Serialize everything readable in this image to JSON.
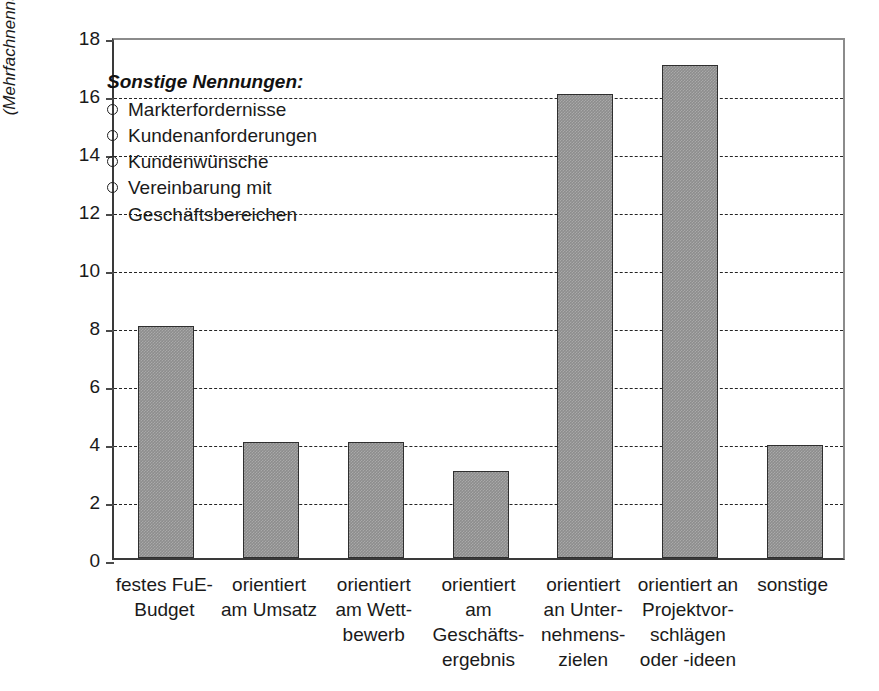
{
  "chart_data": {
    "type": "bar",
    "title": "",
    "subtitle": "",
    "xlabel": "",
    "ylabel": "Anzahl der Nennungen\n(Mehrfachnennungen möglich)",
    "ylim": [
      0,
      18
    ],
    "ytick_values": [
      0,
      2,
      4,
      6,
      8,
      10,
      12,
      14,
      16,
      18
    ],
    "ytick_labels": [
      "0",
      "2",
      "4",
      "6",
      "8",
      "10",
      "12",
      "14",
      "16",
      "18"
    ],
    "grid": "horizontal-dashed",
    "legend_position": "inside-upper-left",
    "bar_color": "#8d8d8d",
    "bar_edge_color": "#2f2f2f",
    "categories": [
      "festes FuE-\nBudget",
      "orientiert\nam Umsatz",
      "orientiert\nam Wett-\nbewerb",
      "orientiert am\nGeschäfts-\nergebnis",
      "orientiert\nan Unter-\nnehmens-\nzielen",
      "orientiert an\nProjektvor-\nschlägen\noder -ideen",
      "sonstige"
    ],
    "values": [
      8,
      4,
      4,
      3,
      16,
      17,
      3.9
    ]
  },
  "legend": {
    "title": "Sonstige Nennungen:",
    "items": [
      {
        "text": "Markterfordernisse",
        "bullet": true
      },
      {
        "text": "Kundenanforderungen",
        "bullet": true
      },
      {
        "text": "Kundenwünsche",
        "bullet": true
      },
      {
        "text": "Vereinbarung mit",
        "bullet": true
      },
      {
        "text": "Geschäftsbereichen",
        "bullet": false
      }
    ]
  }
}
